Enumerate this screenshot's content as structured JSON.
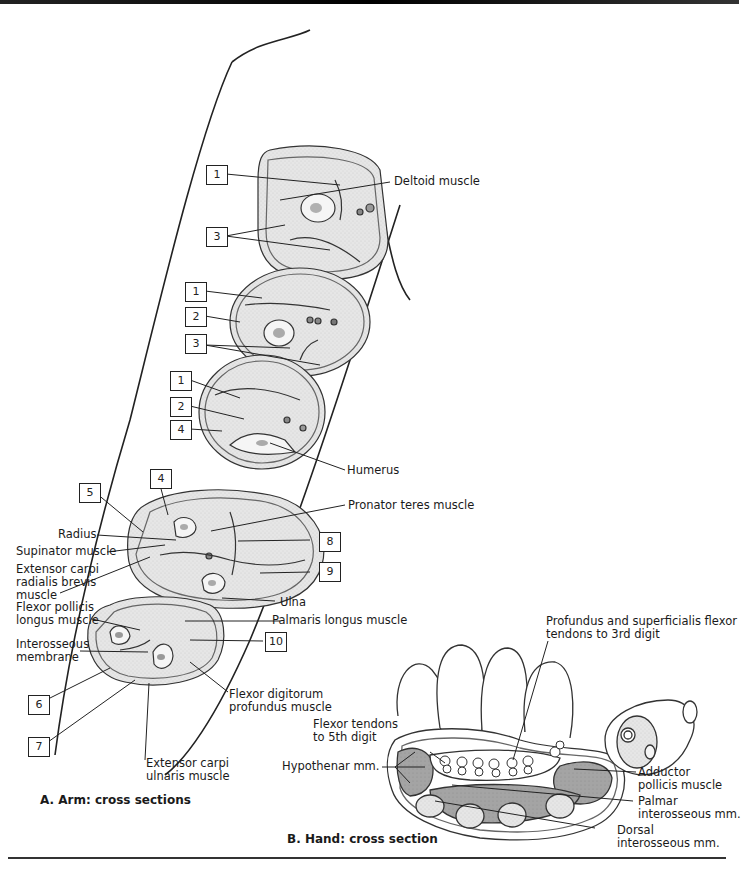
{
  "figure": {
    "panel_a": {
      "caption": "A. Arm: cross sections",
      "number_boxes": [
        {
          "id": "box-1a",
          "text": "1"
        },
        {
          "id": "box-3a",
          "text": "3"
        },
        {
          "id": "box-1b",
          "text": "1"
        },
        {
          "id": "box-2b",
          "text": "2"
        },
        {
          "id": "box-3b",
          "text": "3"
        },
        {
          "id": "box-1c",
          "text": "1"
        },
        {
          "id": "box-2c",
          "text": "2"
        },
        {
          "id": "box-4c",
          "text": "4"
        },
        {
          "id": "box-4d",
          "text": "4"
        },
        {
          "id": "box-5",
          "text": "5"
        },
        {
          "id": "box-8",
          "text": "8"
        },
        {
          "id": "box-9",
          "text": "9"
        },
        {
          "id": "box-10",
          "text": "10"
        },
        {
          "id": "box-6",
          "text": "6"
        },
        {
          "id": "box-7",
          "text": "7"
        }
      ],
      "labels": {
        "deltoid": "Deltoid muscle",
        "humerus": "Humerus",
        "pronator_teres": "Pronator teres muscle",
        "radius": "Radius",
        "supinator": "Supinator muscle",
        "ecrb": "Extensor carpi\nradialis brevis\nmuscle",
        "ulna": "Ulna",
        "fpl": "Flexor pollicis\nlongus muscle",
        "palmaris": "Palmaris longus muscle",
        "interosseous": "Interosseous\nmembrane",
        "fdp": "Flexor digitorum\nprofundus muscle",
        "ecu": "Extensor carpi\nulnaris muscle"
      }
    },
    "panel_b": {
      "caption": "B. Hand: cross section",
      "labels": {
        "profundus": "Profundus and superficialis flexor\ntendons to 3rd digit",
        "flexor_5th": "Flexor tendons\nto 5th digit",
        "hypothenar": "Hypothenar mm.",
        "adductor": "Adductor\npollicis muscle",
        "palmar": "Palmar\ninterosseous mm.",
        "dorsal": "Dorsal\ninterosseous mm."
      }
    },
    "colors": {
      "muscle_fill": "#e4e4e4",
      "muscle_dark": "#9c9c9c",
      "line": "#222222"
    }
  }
}
